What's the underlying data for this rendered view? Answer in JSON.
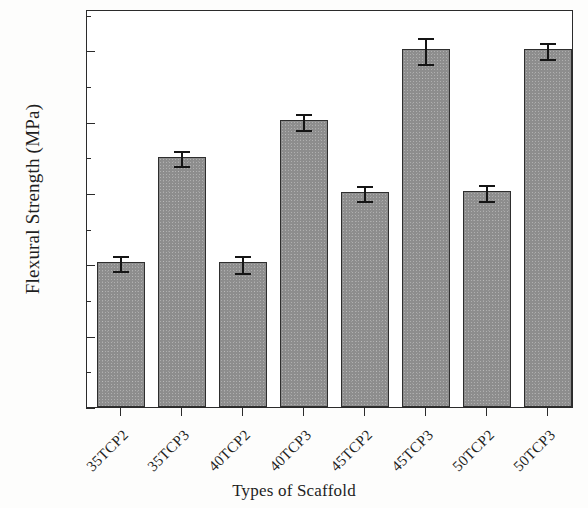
{
  "chart_data": {
    "type": "bar",
    "title": "",
    "xlabel": "Types of Scaffold",
    "ylabel": "Flexural Strength (MPa)",
    "categories": [
      "35TCP2",
      "35TCP3",
      "40TCP2",
      "40TCP3",
      "45TCP2",
      "45TCP3",
      "50TCP2",
      "50TCP3"
    ],
    "values": [
      0.0204,
      0.0351,
      0.0203,
      0.0402,
      0.0302,
      0.0502,
      0.0303,
      0.0502
    ],
    "errors": [
      0.0011,
      0.0011,
      0.0012,
      0.0011,
      0.0011,
      0.0018,
      0.0011,
      0.0011
    ],
    "ylim": [
      0.0,
      0.0558
    ],
    "ytick_labels": [
      "0.00",
      "0.01",
      "0.02",
      "0.03",
      "0.04",
      "0.05"
    ],
    "ytick_values": [
      0.0,
      0.01,
      0.02,
      0.03,
      0.04,
      0.05
    ],
    "yminor_values": [
      0.005,
      0.015,
      0.025,
      0.035,
      0.045,
      0.055
    ],
    "grid": false,
    "legend": null,
    "bar_color": "#8d8d8d",
    "bar_edge_color": "#2e2e2e",
    "axis_color": "#2b2b2b",
    "error_bar_color": "#151515"
  }
}
